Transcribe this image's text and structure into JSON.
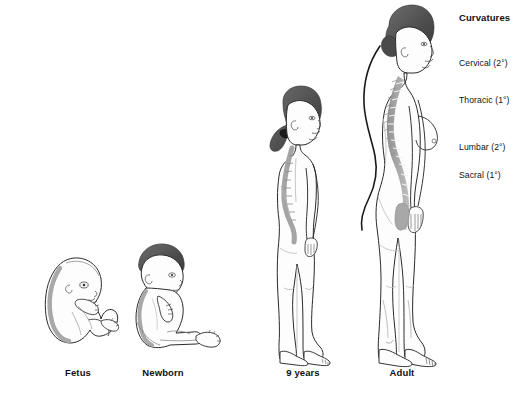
{
  "figure": {
    "background_color": "#ffffff",
    "line_color": "#1a1a1a",
    "hair_color": "#4a4a4a",
    "spine_color": "#9a9a9a",
    "shade_color": "#d8d8d8"
  },
  "stages": [
    {
      "id": "fetus",
      "label": "Fetus",
      "caption_x": 78,
      "caption_y": 372
    },
    {
      "id": "newborn",
      "label": "Newborn",
      "caption_x": 163,
      "caption_y": 372
    },
    {
      "id": "nine-years",
      "label": "9 years",
      "caption_x": 303,
      "caption_y": 372
    },
    {
      "id": "adult",
      "label": "Adult",
      "caption_x": 402,
      "caption_y": 372
    }
  ],
  "legend": {
    "title": "Curvatures",
    "title_x": 459,
    "title_y": 12,
    "entries": [
      {
        "id": "cervical",
        "label": "Cervical (2°)",
        "x": 459,
        "y": 58
      },
      {
        "id": "thoracic",
        "label": "Thoracic (1°)",
        "x": 459,
        "y": 95
      },
      {
        "id": "lumbar",
        "label": "Lumbar (2°)",
        "x": 459,
        "y": 142
      },
      {
        "id": "sacral",
        "label": "Sacral (1°)",
        "x": 459,
        "y": 170
      }
    ]
  }
}
